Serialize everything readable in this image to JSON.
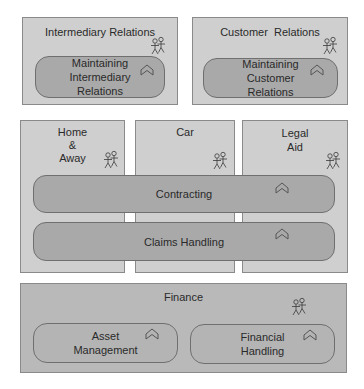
{
  "colors": {
    "background": "#ffffff",
    "box_fill": "#cfcfcf",
    "box_border": "#8a8a8a",
    "process_fill": "#a9a9a9",
    "process_border": "#6f6f6f",
    "finance_fill": "#b4b4b4"
  },
  "top_row": [
    {
      "title": "Intermediary Relations",
      "process": "Maintaining\nIntermediary\nRelations"
    },
    {
      "title": "Customer  Relations",
      "process": "Maintaining\nCustomer\nRelations"
    }
  ],
  "columns": [
    {
      "title": "Home\n&\nAway"
    },
    {
      "title": "Car"
    },
    {
      "title": "Legal\nAid"
    }
  ],
  "shared_processes": [
    {
      "label": "Contracting"
    },
    {
      "label": "Claims Handling"
    }
  ],
  "finance": {
    "title": "Finance",
    "processes": [
      {
        "label": "Asset\nManagement"
      },
      {
        "label": "Financial\nHandling"
      }
    ]
  },
  "icons": {
    "actor": "actor-pair-icon",
    "process": "chevron-up-arrow-icon"
  }
}
